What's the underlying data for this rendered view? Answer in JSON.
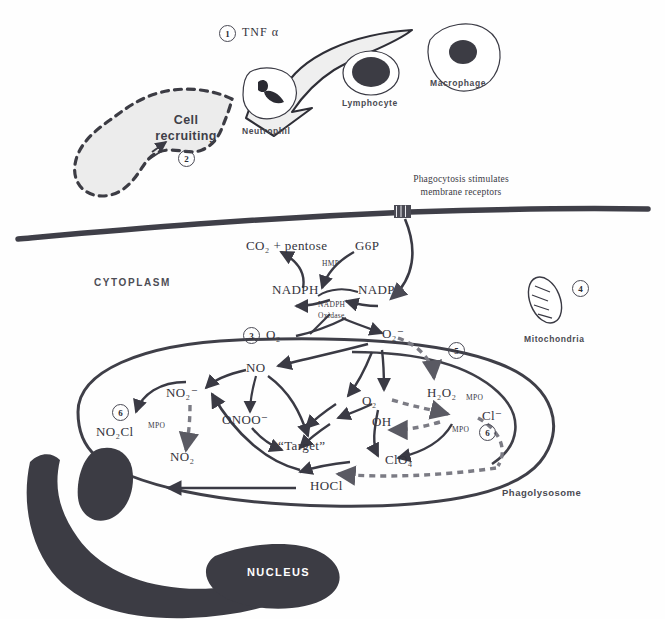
{
  "figure": {
    "background": "#fefefe",
    "ink": "#3a3a44"
  },
  "top_scene": {
    "cytokine_marker": "1",
    "cytokine_label": "TNF α",
    "cells": [
      {
        "name": "neutrophil-cell",
        "label": "Neutrophil"
      },
      {
        "name": "lymphocyte-cell",
        "label": "Lymphocyte"
      },
      {
        "name": "macrophage-cell",
        "label": "Macrophage"
      }
    ],
    "recruiting_label_line1": "Cell",
    "recruiting_label_line2": "recruiting",
    "recruiting_marker": "2"
  },
  "membrane": {
    "receptor_text_line1": "Phagocytosis stimulates",
    "receptor_text_line2": "membrane receptors",
    "cytoplasm_label": "CYTOPLASM"
  },
  "organelles": {
    "mitochondria_label": "Mitochondria",
    "mitochondria_marker": "4",
    "nucleus_label": "NUCLEUS",
    "phagolysosome_label": "Phagolysosome"
  },
  "hmp_pathway": {
    "substrate": "G6P",
    "products": "CO₂ + pentose",
    "enzyme_label": "HMP",
    "cofactor_reduced": "NADPH",
    "cofactor_oxidized": "NADP",
    "oxidase_line1": "NADPH",
    "oxidase_line2": "Oxidase",
    "oxygen_in": "O₂",
    "oxygen_marker": "3",
    "superoxide": "O₂⁻"
  },
  "reactive_species": [
    {
      "name": "nitric-oxide",
      "label": "NO"
    },
    {
      "name": "nitrite",
      "label": "NO₂⁻"
    },
    {
      "name": "nitryl-chloride",
      "label": "NO₂Cl"
    },
    {
      "name": "nitrogen-dioxide",
      "label": "NO₂"
    },
    {
      "name": "peroxynitrite",
      "label": "ONOO⁻"
    },
    {
      "name": "target",
      "label": "“Target”"
    },
    {
      "name": "dioxygen",
      "label": "O₂"
    },
    {
      "name": "hydroxyl-radical",
      "label": "OH"
    },
    {
      "name": "hydrogen-peroxide",
      "label": "H₂O₂"
    },
    {
      "name": "chloride",
      "label": "Cl⁻"
    },
    {
      "name": "perchlorate",
      "label": "ClO₄"
    },
    {
      "name": "hypochlorous-acid",
      "label": "HOCl"
    }
  ],
  "enzymes": {
    "mpo_left": "MPO",
    "mpo_right_upper": "MPO",
    "mpo_right_lower": "MPO"
  },
  "markers": {
    "m1": "1",
    "m2": "2",
    "m3": "3",
    "m4": "4",
    "m5": "5",
    "m6_left": "6",
    "m6_right": "6"
  }
}
